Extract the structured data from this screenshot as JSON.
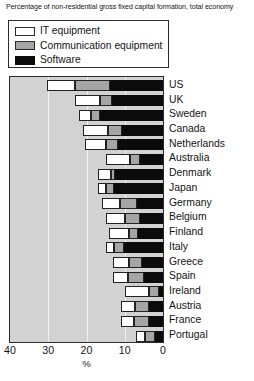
{
  "subtitle": "Percentage of non-residential gross fixed capital formation, total economy",
  "legend": {
    "items": [
      {
        "label": "IT equipment",
        "swatch": "it-equipment-swatch",
        "color": "#ffffff"
      },
      {
        "label": "Communication equipment",
        "swatch": "communication-equipment-swatch",
        "color": "#a5a5a5"
      },
      {
        "label": "Software",
        "swatch": "software-swatch",
        "color": "#0b0b0b"
      }
    ]
  },
  "axis": {
    "ticks": [
      "40",
      "30",
      "20",
      "10",
      "0"
    ],
    "tick_values": [
      40,
      30,
      20,
      10,
      0
    ],
    "title": "%",
    "reversed": true
  },
  "chart_data": {
    "type": "bar",
    "orientation": "horizontal-stacked",
    "title": "",
    "subtitle": "Percentage of non-residential gross fixed capital formation, total economy",
    "xlabel": "%",
    "ylabel": "",
    "xlim": [
      40,
      0
    ],
    "grid": true,
    "gridlines": [
      30,
      20,
      10
    ],
    "legend_position": "top-left",
    "categories": [
      "US",
      "UK",
      "Sweden",
      "Canada",
      "Netherlands",
      "Australia",
      "Denmark",
      "Japan",
      "Germany",
      "Belgium",
      "Finland",
      "Italy",
      "Greece",
      "Spain",
      "Ireland",
      "Austria",
      "France",
      "Portugal"
    ],
    "series": [
      {
        "name": "IT equipment",
        "color": "#ffffff",
        "values": [
          7.2,
          6.6,
          3.1,
          6.6,
          5.6,
          6.3,
          3.3,
          2.2,
          4.8,
          5.0,
          5.1,
          2.3,
          4.2,
          3.9,
          6.3,
          3.8,
          3.4,
          2.4
        ]
      },
      {
        "name": "Communication equipment",
        "color": "#a5a5a5",
        "values": [
          9.3,
          3.1,
          2.5,
          3.6,
          3.2,
          2.6,
          1.1,
          2.1,
          4.4,
          4.0,
          2.4,
          2.6,
          3.4,
          4.1,
          2.6,
          3.6,
          4.0,
          2.6
        ]
      },
      {
        "name": "Software",
        "color": "#0b0b0b",
        "values": [
          13.8,
          13.3,
          16.4,
          10.8,
          11.7,
          6.1,
          12.6,
          12.7,
          6.8,
          6.0,
          6.5,
          10.1,
          5.4,
          5.0,
          1.1,
          3.6,
          3.6,
          2.0
        ]
      }
    ],
    "totals": [
      30.3,
      23.0,
      22.0,
      21.0,
      20.5,
      15.0,
      17.0,
      17.0,
      16.0,
      15.0,
      14.0,
      15.0,
      13.0,
      13.0,
      10.0,
      11.0,
      11.0,
      7.0
    ]
  }
}
